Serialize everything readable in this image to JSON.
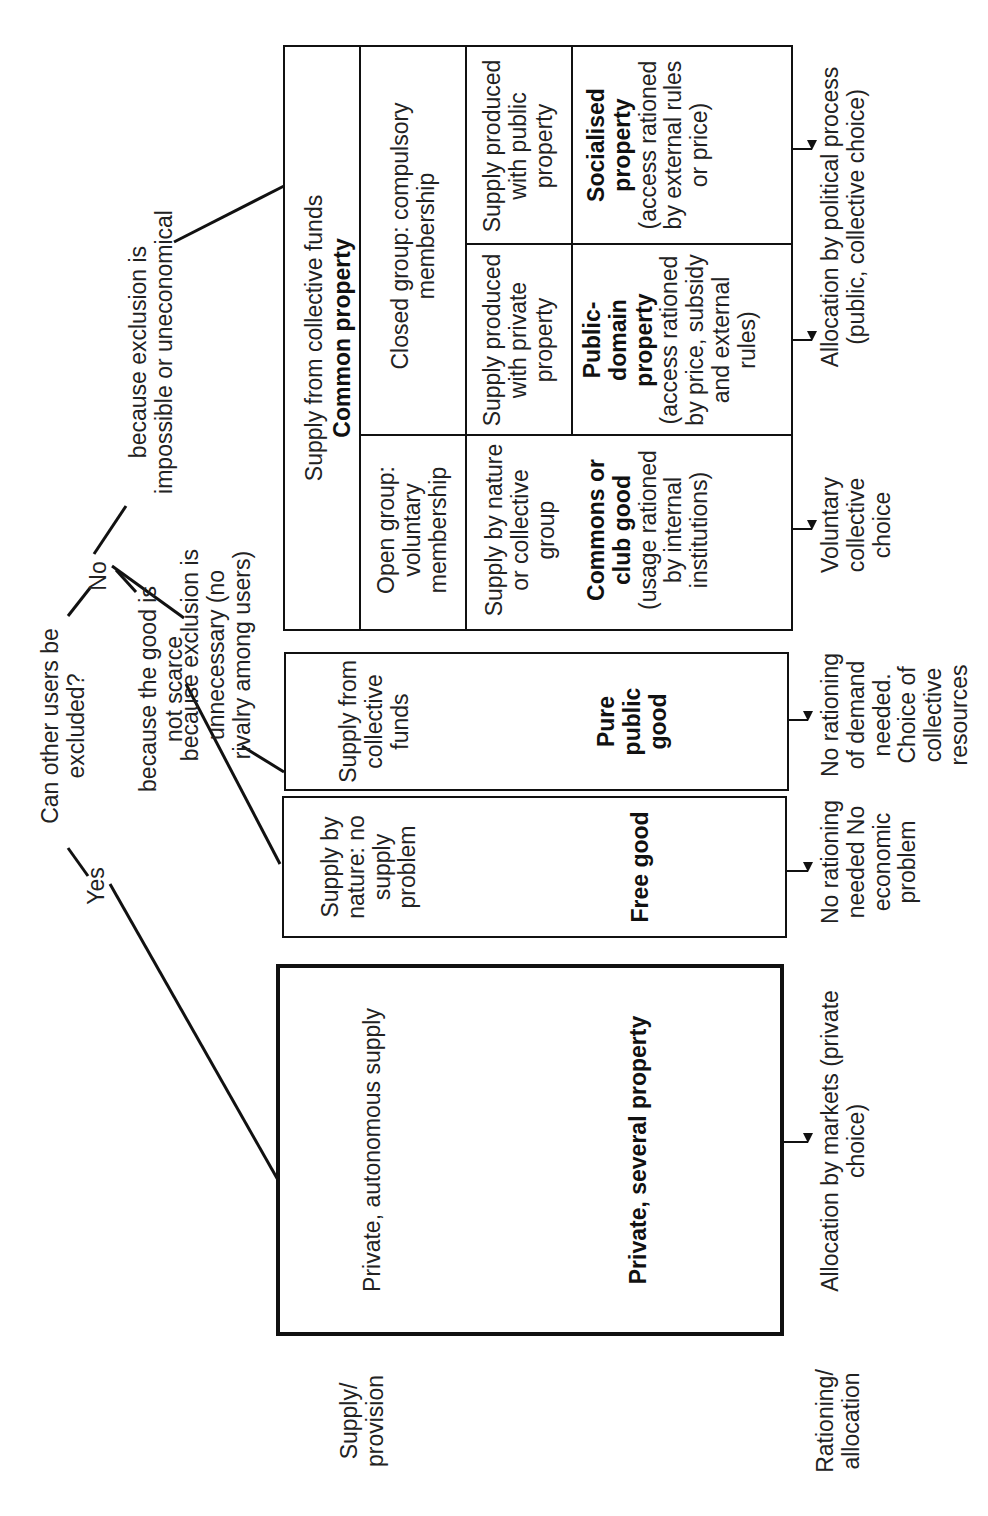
{
  "question": "Can other users be excluded?",
  "answers": {
    "yes": "Yes",
    "no": "No"
  },
  "reasons": {
    "not_scarce": "because the good is not scarce",
    "unnecessary": "because exclusion is unnecessary (no rivalry among users)",
    "impossible": "because exclusion is impossible or uneconomical"
  },
  "row_labels": {
    "supply": "Supply/ provision",
    "rationing": "Rationing/ allocation"
  },
  "boxes": {
    "private": {
      "supply": "Private, autonomous supply",
      "name": "Private, several property",
      "allocation": "Allocation by markets (private choice)"
    },
    "free_good": {
      "supply": "Supply by nature: no supply problem",
      "name": "Free good",
      "allocation": "No rationing needed No economic problem"
    },
    "pure_public": {
      "supply": "Supply from collective funds",
      "name": "Pure public good",
      "allocation": "No rationing of demand needed. Choice of collective resources"
    },
    "common": {
      "header_supply": "Supply from collective funds",
      "header_name": "Common property",
      "open_group": "Open group: voluntary membership",
      "closed_group": "Closed group: compulsory membership",
      "commons": {
        "supply": "Supply by nature or collective group",
        "name": "Commons or club good",
        "detail": "(usage rationed by internal institutions)",
        "allocation": "Voluntary collective choice"
      },
      "public_domain": {
        "supply": "Supply produced with private property",
        "name": "Public-domain property",
        "detail": "(access rationed by price, subsidy and external rules)"
      },
      "socialised": {
        "supply": "Supply produced with public property",
        "name": "Socialised property",
        "detail": "(access rationed by external rules or price)"
      },
      "allocation": "Allocation by political process (public, collective choice)"
    }
  }
}
